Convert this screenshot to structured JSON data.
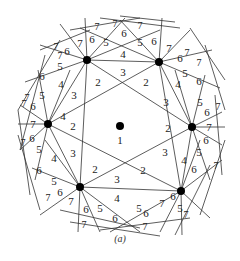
{
  "figure": {
    "caption": "(a)",
    "center_label": "1",
    "colors": {
      "line": "#333333",
      "dot": "#000000",
      "text": "#222222",
      "background": "#ffffff"
    }
  },
  "dots": [
    {
      "id": "center",
      "x": 120,
      "y": 126
    },
    {
      "id": "top-left",
      "x": 87,
      "y": 60
    },
    {
      "id": "top-right",
      "x": 159,
      "y": 62
    },
    {
      "id": "right",
      "x": 192,
      "y": 127
    },
    {
      "id": "bottom-right",
      "x": 181,
      "y": 191
    },
    {
      "id": "bottom-left",
      "x": 80,
      "y": 187
    },
    {
      "id": "left",
      "x": 48,
      "y": 124
    }
  ],
  "labels": [
    {
      "t": "1",
      "x": 120,
      "y": 140
    },
    {
      "t": "2",
      "x": 98,
      "y": 82
    },
    {
      "t": "3",
      "x": 123,
      "y": 72
    },
    {
      "t": "2",
      "x": 146,
      "y": 82
    },
    {
      "t": "3",
      "x": 166,
      "y": 102
    },
    {
      "t": "2",
      "x": 168,
      "y": 128
    },
    {
      "t": "3",
      "x": 165,
      "y": 152
    },
    {
      "t": "2",
      "x": 143,
      "y": 170
    },
    {
      "t": "3",
      "x": 117,
      "y": 179
    },
    {
      "t": "2",
      "x": 95,
      "y": 169
    },
    {
      "t": "3",
      "x": 73,
      "y": 153
    },
    {
      "t": "2",
      "x": 73,
      "y": 126
    },
    {
      "t": "3",
      "x": 74,
      "y": 95
    },
    {
      "t": "4",
      "x": 123,
      "y": 54
    },
    {
      "t": "4",
      "x": 61,
      "y": 84
    },
    {
      "t": "4",
      "x": 63,
      "y": 116
    },
    {
      "t": "4",
      "x": 178,
      "y": 84
    },
    {
      "t": "4",
      "x": 184,
      "y": 160
    },
    {
      "t": "4",
      "x": 117,
      "y": 198
    },
    {
      "t": "4",
      "x": 54,
      "y": 158
    },
    {
      "t": "5",
      "x": 106,
      "y": 42
    },
    {
      "t": "5",
      "x": 140,
      "y": 42
    },
    {
      "t": "5",
      "x": 60,
      "y": 66
    },
    {
      "t": "5",
      "x": 42,
      "y": 95
    },
    {
      "t": "5",
      "x": 185,
      "y": 73
    },
    {
      "t": "5",
      "x": 200,
      "y": 102
    },
    {
      "t": "5",
      "x": 199,
      "y": 152
    },
    {
      "t": "5",
      "x": 180,
      "y": 208
    },
    {
      "t": "5",
      "x": 100,
      "y": 208
    },
    {
      "t": "5",
      "x": 139,
      "y": 208
    },
    {
      "t": "5",
      "x": 39,
      "y": 149
    },
    {
      "t": "5",
      "x": 54,
      "y": 181
    },
    {
      "t": "6",
      "x": 92,
      "y": 39
    },
    {
      "t": "6",
      "x": 124,
      "y": 33
    },
    {
      "t": "6",
      "x": 154,
      "y": 41
    },
    {
      "t": "6",
      "x": 67,
      "y": 51
    },
    {
      "t": "6",
      "x": 42,
      "y": 76
    },
    {
      "t": "6",
      "x": 33,
      "y": 106
    },
    {
      "t": "6",
      "x": 180,
      "y": 58
    },
    {
      "t": "6",
      "x": 199,
      "y": 81
    },
    {
      "t": "6",
      "x": 207,
      "y": 112
    },
    {
      "t": "6",
      "x": 206,
      "y": 140
    },
    {
      "t": "6",
      "x": 194,
      "y": 169
    },
    {
      "t": "6",
      "x": 173,
      "y": 196
    },
    {
      "t": "6",
      "x": 146,
      "y": 213
    },
    {
      "t": "6",
      "x": 115,
      "y": 218
    },
    {
      "t": "6",
      "x": 86,
      "y": 209
    },
    {
      "t": "6",
      "x": 60,
      "y": 192
    },
    {
      "t": "6",
      "x": 39,
      "y": 170
    },
    {
      "t": "6",
      "x": 32,
      "y": 138
    },
    {
      "t": "7",
      "x": 80,
      "y": 43
    },
    {
      "t": "7",
      "x": 169,
      "y": 48
    },
    {
      "t": "7",
      "x": 33,
      "y": 124
    },
    {
      "t": "7",
      "x": 209,
      "y": 127
    },
    {
      "t": "7",
      "x": 71,
      "y": 201
    },
    {
      "t": "7",
      "x": 162,
      "y": 203
    }
  ],
  "small_sevens": [
    {
      "t": "7",
      "x": 97,
      "y": 26
    },
    {
      "t": "7",
      "x": 115,
      "y": 23
    },
    {
      "t": "7",
      "x": 140,
      "y": 25
    },
    {
      "t": "7",
      "x": 56,
      "y": 46
    },
    {
      "t": "7",
      "x": 60,
      "y": 55
    },
    {
      "t": "7",
      "x": 27,
      "y": 97
    },
    {
      "t": "7",
      "x": 24,
      "y": 103
    },
    {
      "t": "7",
      "x": 23,
      "y": 142
    },
    {
      "t": "7",
      "x": 48,
      "y": 197
    },
    {
      "t": "7",
      "x": 84,
      "y": 224
    },
    {
      "t": "7",
      "x": 145,
      "y": 226
    },
    {
      "t": "7",
      "x": 186,
      "y": 214
    },
    {
      "t": "7",
      "x": 216,
      "y": 165
    },
    {
      "t": "7",
      "x": 218,
      "y": 106
    },
    {
      "t": "7",
      "x": 187,
      "y": 52
    },
    {
      "t": "7",
      "x": 199,
      "y": 62
    }
  ]
}
